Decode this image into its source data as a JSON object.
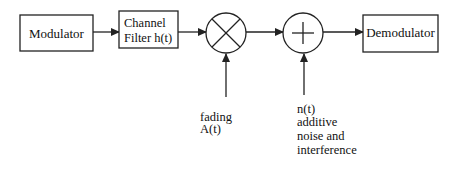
{
  "diagram": {
    "type": "communication-system-block-diagram",
    "colors": {
      "stroke": "#222222",
      "text": "#111111",
      "background": "#ffffff"
    },
    "blocks": [
      {
        "id": "modulator",
        "shape": "rect",
        "label": "Modulator"
      },
      {
        "id": "channel_filter",
        "shape": "rect",
        "label_line1": "Channel",
        "label_line2": "Filter h(t)"
      },
      {
        "id": "multiplier",
        "shape": "circle",
        "symbol": "×",
        "icon": "multiply-icon"
      },
      {
        "id": "adder",
        "shape": "circle",
        "symbol": "+",
        "icon": "plus-icon"
      },
      {
        "id": "demodulator",
        "shape": "rect",
        "label": "Demodulator"
      }
    ],
    "inputs": {
      "fading": {
        "line1": "fading",
        "line2": "A(t)"
      },
      "noise": {
        "line1": "n(t)",
        "line2": "additive",
        "line3": "noise and",
        "line4": "interference"
      }
    },
    "edges": [
      {
        "from": "modulator",
        "to": "channel_filter"
      },
      {
        "from": "channel_filter",
        "to": "multiplier"
      },
      {
        "from": "multiplier",
        "to": "adder"
      },
      {
        "from": "adder",
        "to": "demodulator"
      },
      {
        "from": "fading",
        "to": "multiplier"
      },
      {
        "from": "noise",
        "to": "adder"
      }
    ]
  }
}
